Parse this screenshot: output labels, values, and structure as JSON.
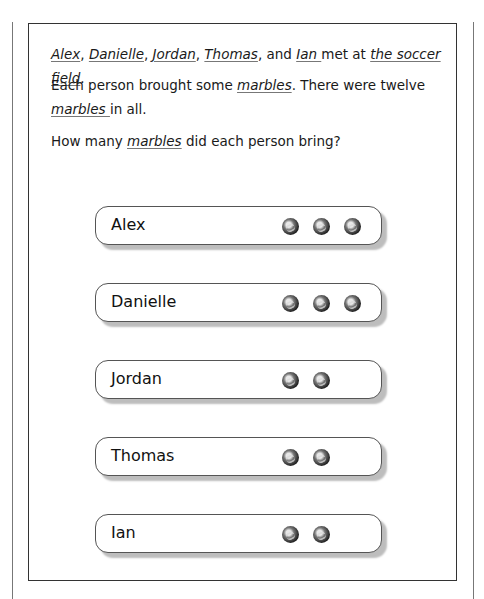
{
  "problem": {
    "sentence1": [
      {
        "text": "Alex",
        "underlined": true
      },
      {
        "text": ", ",
        "underlined": false
      },
      {
        "text": "Danielle",
        "underlined": true
      },
      {
        "text": ", ",
        "underlined": false
      },
      {
        "text": "Jordan",
        "underlined": true
      },
      {
        "text": ", ",
        "underlined": false
      },
      {
        "text": "Thomas",
        "underlined": true
      },
      {
        "text": ", and ",
        "underlined": false
      },
      {
        "text": "Ian ",
        "underlined": true
      },
      {
        "text": "met at ",
        "underlined": false
      },
      {
        "text": "the soccer field",
        "underlined": true
      },
      {
        "text": ".",
        "underlined": false
      }
    ],
    "sentence2": [
      {
        "text": "Each person brought some ",
        "underlined": false
      },
      {
        "text": "marbles",
        "underlined": true
      },
      {
        "text": ". There were twelve ",
        "underlined": false
      },
      {
        "text": "marbles ",
        "underlined": true
      },
      {
        "text": "in all.",
        "underlined": false
      }
    ],
    "question": [
      {
        "text": "How many ",
        "underlined": false
      },
      {
        "text": "marbles",
        "underlined": true
      },
      {
        "text": " did each person bring?",
        "underlined": false
      }
    ]
  },
  "people": [
    {
      "name": "Alex",
      "marbles": 3
    },
    {
      "name": "Danielle",
      "marbles": 3
    },
    {
      "name": "Jordan",
      "marbles": 2
    },
    {
      "name": "Thomas",
      "marbles": 2
    },
    {
      "name": "Ian",
      "marbles": 2
    }
  ],
  "icons": {
    "marble": "marble-icon"
  }
}
